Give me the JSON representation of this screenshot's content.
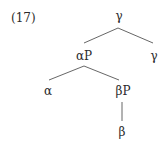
{
  "example_number": "(17)",
  "tree": {
    "root": {
      "label": "γ"
    },
    "root_left": {
      "label": "αP"
    },
    "root_right": {
      "label": "γ"
    },
    "ap_left": {
      "label": "α"
    },
    "ap_right": {
      "label": "βP"
    },
    "bp_child": {
      "label": "β"
    }
  },
  "colors": {
    "text": "#2b2b2b",
    "lines": "#555555"
  }
}
